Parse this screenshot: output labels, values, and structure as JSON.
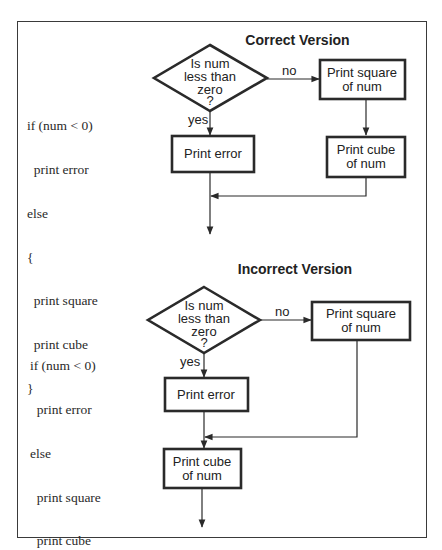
{
  "correct": {
    "title": "Correct Version",
    "code": [
      "if (num < 0)",
      "  print error",
      "else",
      "{",
      "  print square",
      "  print cube",
      "}"
    ],
    "decision": {
      "lines": [
        "Is num",
        "less than",
        "zero",
        "?"
      ]
    },
    "yes_label": "yes",
    "no_label": "no",
    "box_square": [
      "Print square",
      "of num"
    ],
    "box_error": [
      "Print error"
    ],
    "box_cube": [
      "Print cube",
      "of num"
    ]
  },
  "incorrect": {
    "title": "Incorrect Version",
    "code": [
      "if (num < 0)",
      "  print error",
      "else",
      "  print square",
      "  print cube"
    ],
    "decision": {
      "lines": [
        "Is num",
        "less than",
        "zero",
        "?"
      ]
    },
    "yes_label": "yes",
    "no_label": "no",
    "box_square": [
      "Print square",
      "of num"
    ],
    "box_error": [
      "Print error"
    ],
    "box_cube": [
      "Print cube",
      "of num"
    ]
  },
  "colors": {
    "stroke": "#2a2a2a",
    "background": "#ffffff"
  }
}
